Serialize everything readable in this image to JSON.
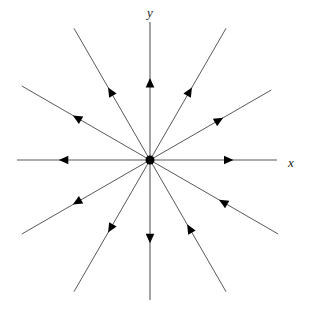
{
  "figure": {
    "kind": "phase-portrait",
    "title": "",
    "background_color": "#ffffff",
    "line_color": "#595959",
    "arrow_color": "#000000",
    "origin_dot_color": "#000000",
    "label_color": "#1a1a1a"
  },
  "axes": {
    "x_label": "x",
    "y_label": "y",
    "origin": {
      "x": 150,
      "y": 160
    },
    "x_axis": {
      "from_x": 17,
      "to_x": 277,
      "y": 160
    },
    "y_axis": {
      "x": 150,
      "from_y": 22,
      "to_y": 300
    },
    "x_label_pos": {
      "x": 291,
      "y": 164
    },
    "y_label_pos": {
      "x": 150,
      "y": 14
    }
  },
  "chart_data": {
    "type": "scatter",
    "xlabel": "x",
    "ylabel": "y",
    "grid": false,
    "legend": null,
    "origin_marker": {
      "shape": "filled-circle",
      "radius": 4.5,
      "color": "#000000"
    },
    "ray_count": 12,
    "ray_angle_step_degrees": 30,
    "rays": [
      {
        "name": "ray-east",
        "angle_deg": 0,
        "length": 127,
        "arrow_at": 0.62,
        "direction": "outward",
        "is_axis": true
      },
      {
        "name": "ray-ene",
        "angle_deg": 30,
        "length": 140,
        "arrow_at": 0.57,
        "direction": "outward",
        "is_axis": false
      },
      {
        "name": "ray-nne",
        "angle_deg": 60,
        "length": 152,
        "arrow_at": 0.52,
        "direction": "outward",
        "is_axis": false
      },
      {
        "name": "ray-north",
        "angle_deg": 90,
        "length": 138,
        "arrow_at": 0.56,
        "direction": "outward",
        "is_axis": true
      },
      {
        "name": "ray-nnw",
        "angle_deg": 120,
        "length": 152,
        "arrow_at": 0.52,
        "direction": "outward",
        "is_axis": false
      },
      {
        "name": "ray-wnw",
        "angle_deg": 150,
        "length": 148,
        "arrow_at": 0.57,
        "direction": "outward",
        "is_axis": false
      },
      {
        "name": "ray-west",
        "angle_deg": 180,
        "length": 133,
        "arrow_at": 0.65,
        "direction": "outward",
        "is_axis": true
      },
      {
        "name": "ray-wsw",
        "angle_deg": 210,
        "length": 148,
        "arrow_at": 0.57,
        "direction": "outward",
        "is_axis": false
      },
      {
        "name": "ray-ssw",
        "angle_deg": 240,
        "length": 152,
        "arrow_at": 0.52,
        "direction": "outward",
        "is_axis": false
      },
      {
        "name": "ray-south",
        "angle_deg": 270,
        "length": 140,
        "arrow_at": 0.56,
        "direction": "outward",
        "is_axis": true
      },
      {
        "name": "ray-sse",
        "angle_deg": 300,
        "length": 152,
        "arrow_at": 0.52,
        "direction": "inward",
        "is_axis": false
      },
      {
        "name": "ray-ese",
        "angle_deg": 330,
        "length": 148,
        "arrow_at": 0.57,
        "direction": "inward",
        "is_axis": false
      }
    ]
  }
}
